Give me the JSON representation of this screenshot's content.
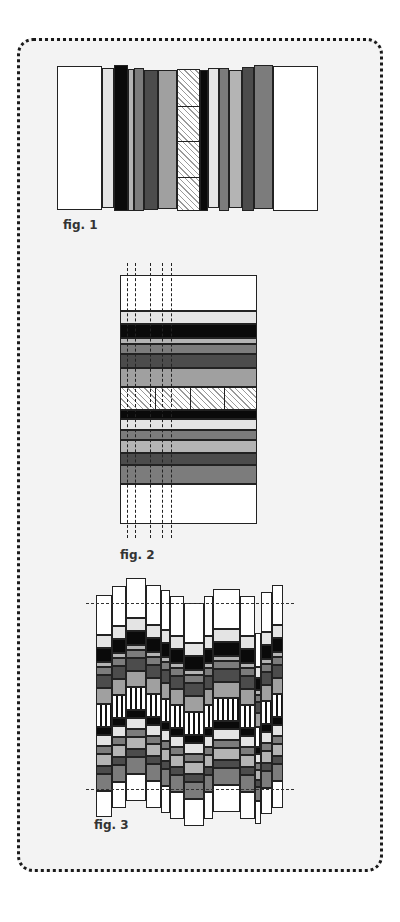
{
  "figures": [
    {
      "id": "fig1",
      "label": "fig. 1"
    },
    {
      "id": "fig2",
      "label": "fig. 2"
    },
    {
      "id": "fig3",
      "label": "fig. 3"
    }
  ],
  "colors": {
    "white": "#ffffff",
    "light": "#e4e4e4",
    "lightgray": "#b4b4b4",
    "midgray": "#a0a0a0",
    "gray": "#7c7c7c",
    "darkgray": "#4c4c4c",
    "black": "#0a0a0a",
    "panel_bg": "#f3f3f3",
    "border": "#1a1a1a"
  },
  "fig1_strips": [
    {
      "x": 57,
      "w": 45,
      "top": 66,
      "bottom": 210,
      "fill": "white"
    },
    {
      "x": 102,
      "w": 12,
      "top": 68,
      "bottom": 208,
      "fill": "light"
    },
    {
      "x": 114,
      "w": 14,
      "top": 65,
      "bottom": 211,
      "fill": "black"
    },
    {
      "x": 128,
      "w": 6,
      "top": 69,
      "bottom": 211,
      "fill": "lightgray"
    },
    {
      "x": 134,
      "w": 10,
      "top": 68,
      "bottom": 211,
      "fill": "gray"
    },
    {
      "x": 144,
      "w": 14,
      "top": 70,
      "bottom": 210,
      "fill": "darkgray"
    },
    {
      "x": 158,
      "w": 19,
      "top": 70,
      "bottom": 209,
      "fill": "midgray"
    },
    {
      "x": 177,
      "w": 23,
      "top": 69,
      "bottom": 211,
      "fill": "hatch",
      "cells": 4
    },
    {
      "x": 200,
      "w": 8,
      "top": 70,
      "bottom": 211,
      "fill": "black"
    },
    {
      "x": 208,
      "w": 11,
      "top": 68,
      "bottom": 208,
      "fill": "light"
    },
    {
      "x": 219,
      "w": 10,
      "top": 68,
      "bottom": 211,
      "fill": "gray"
    },
    {
      "x": 229,
      "w": 13,
      "top": 70,
      "bottom": 208,
      "fill": "lightgray"
    },
    {
      "x": 242,
      "w": 12,
      "top": 67,
      "bottom": 211,
      "fill": "darkgray"
    },
    {
      "x": 254,
      "w": 19,
      "top": 65,
      "bottom": 209,
      "fill": "gray"
    },
    {
      "x": 273,
      "w": 45,
      "top": 66,
      "bottom": 211,
      "fill": "white"
    }
  ],
  "fig2_bands": [
    {
      "h": 36,
      "fill": "white"
    },
    {
      "h": 13,
      "fill": "light"
    },
    {
      "h": 14,
      "fill": "black"
    },
    {
      "h": 6,
      "fill": "lightgray"
    },
    {
      "h": 10,
      "fill": "gray"
    },
    {
      "h": 14,
      "fill": "darkgray"
    },
    {
      "h": 19,
      "fill": "midgray"
    },
    {
      "h": 23,
      "fill": "hatch",
      "cells": 4
    },
    {
      "h": 9,
      "fill": "black"
    },
    {
      "h": 11,
      "fill": "light"
    },
    {
      "h": 10,
      "fill": "gray"
    },
    {
      "h": 13,
      "fill": "lightgray"
    },
    {
      "h": 12,
      "fill": "darkgray"
    },
    {
      "h": 19,
      "fill": "gray"
    },
    {
      "h": 40,
      "fill": "white"
    }
  ],
  "fig2_dash_x": [
    127,
    135,
    150,
    162,
    171
  ],
  "fig3_dash_y": [
    603,
    789
  ],
  "fig3_label_offset": 0
}
